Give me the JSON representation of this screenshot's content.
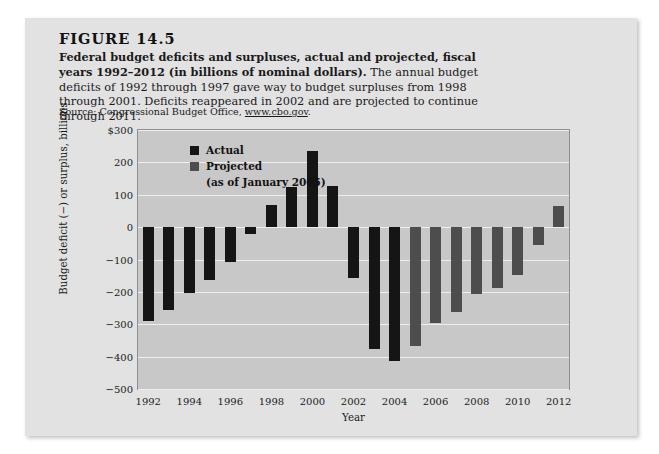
{
  "figure": {
    "number": "FIGURE 14.5",
    "caption_bold": "Federal budget deficits and surpluses, actual and projected, fiscal years 1992–2012 (in billions of nominal dollars).",
    "caption_rest": " The annual budget deficits of 1992 through 1997 gave way to budget surpluses from 1998 through 2001. Deficits reappeared in 2002 and are projected to continue through 2011.",
    "source_prefix": "Source: Congressional Budget Office, ",
    "source_url": "www.cbo.gov",
    "source_suffix": "."
  },
  "colors": {
    "panel_background": "#e2e2e2",
    "plot_background": "#c8c8c8",
    "gridline": "#efefef",
    "actual_bar": "#151515",
    "projected_bar": "#4d4d4d",
    "text": "#1a1a1a"
  },
  "legend": {
    "position": "inside-top-left",
    "entries": [
      {
        "label": "Actual",
        "color": "#151515",
        "sublabel": ""
      },
      {
        "label": "Projected",
        "color": "#4d4d4d",
        "sublabel": "(as of January 2005)"
      }
    ]
  },
  "chart_data": {
    "type": "bar",
    "title": "Federal budget deficits and surpluses, actual and projected, fiscal years 1992–2012 (in billions of nominal dollars)",
    "xlabel": "Year",
    "ylabel": "Budget deficit (−) or surplus, billions",
    "ylim": [
      -500,
      300
    ],
    "ytick_values": [
      300,
      200,
      100,
      0,
      -100,
      -200,
      -300,
      -400,
      -500
    ],
    "ytick_labels": [
      "$300",
      "200",
      "100",
      "0",
      "−100",
      "−200",
      "−300",
      "−400",
      "−500"
    ],
    "xlim": [
      1991.5,
      2012.5
    ],
    "xtick_values": [
      1992,
      1994,
      1996,
      1998,
      2000,
      2002,
      2004,
      2006,
      2008,
      2010,
      2012
    ],
    "xtick_labels": [
      "1992",
      "1994",
      "1996",
      "1998",
      "2000",
      "2002",
      "2004",
      "2006",
      "2008",
      "2010",
      "2012"
    ],
    "grid": "horizontal",
    "categories": [
      1992,
      1993,
      1994,
      1995,
      1996,
      1997,
      1998,
      1999,
      2000,
      2001,
      2002,
      2003,
      2004,
      2005,
      2006,
      2007,
      2008,
      2009,
      2010,
      2011,
      2012
    ],
    "series": [
      {
        "name": "Actual",
        "color": "#151515",
        "values": [
          -290,
          -255,
          -203,
          -164,
          -107,
          -22,
          69,
          125,
          236,
          128,
          -158,
          -375,
          -412,
          null,
          null,
          null,
          null,
          null,
          null,
          null,
          null
        ]
      },
      {
        "name": "Projected",
        "color": "#4d4d4d",
        "values": [
          null,
          null,
          null,
          null,
          null,
          null,
          null,
          null,
          null,
          null,
          null,
          null,
          null,
          -368,
          -295,
          -261,
          -207,
          -189,
          -148,
          -55,
          65
        ]
      }
    ]
  }
}
